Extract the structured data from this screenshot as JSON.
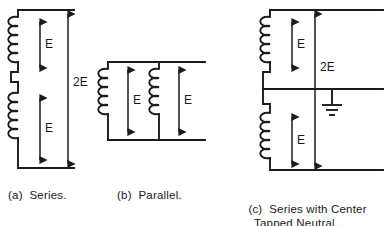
{
  "figure": {
    "background": "#ffffff",
    "ink_color": "#1c1c1c",
    "diagrams": [
      {
        "id": "series",
        "caption_label": "(a)",
        "caption_text": "Series.",
        "caption_full": "(a)  Series.",
        "windings": [
          {
            "name": "upper-winding",
            "turns": 5,
            "voltage_label": "E"
          },
          {
            "name": "lower-winding",
            "turns": 5,
            "voltage_label": "E"
          }
        ],
        "total_label": "2E",
        "connection": "series",
        "has_ground": false,
        "has_center_tap": false
      },
      {
        "id": "parallel",
        "caption_label": "(b)",
        "caption_text": "Parallel.",
        "caption_full": "(b)  Parallel.",
        "windings": [
          {
            "name": "left-winding",
            "turns": 5,
            "voltage_label": "E"
          },
          {
            "name": "right-winding",
            "turns": 5,
            "voltage_label": "E"
          }
        ],
        "total_label": "E",
        "connection": "parallel",
        "has_ground": false,
        "has_center_tap": false
      },
      {
        "id": "series-center-tapped",
        "caption_label": "(c)",
        "caption_text_line1": "Series with Center",
        "caption_text_line2": "Tapped Neutral.",
        "caption_full": "(c)  Series with Center Tapped Neutral.",
        "windings": [
          {
            "name": "upper-winding",
            "turns": 5,
            "voltage_label": "E"
          },
          {
            "name": "lower-winding",
            "turns": 5,
            "voltage_label": "E"
          }
        ],
        "total_label": "2E",
        "connection": "series",
        "has_ground": true,
        "has_center_tap": true,
        "ground_symbol": "earth-ground"
      }
    ],
    "labels": {
      "e_upper_a": "E",
      "e_lower_a": "E",
      "total_a": "2E",
      "e_left_b": "E",
      "e_right_b": "E",
      "e_upper_c": "E",
      "e_lower_c": "E",
      "total_c": "2E"
    }
  }
}
